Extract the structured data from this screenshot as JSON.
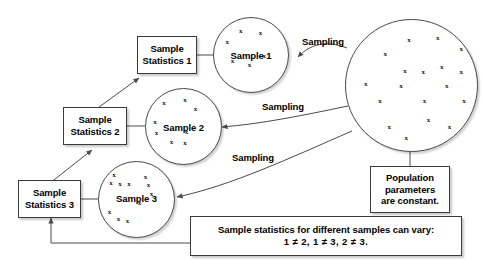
{
  "diagram": {
    "stroke_color": "#3b3b3b",
    "background": "#ffffff"
  },
  "stat_boxes": [
    {
      "line1": "Sample",
      "line2": "Statistics 1"
    },
    {
      "line1": "Sample",
      "line2": "Statistics 2"
    },
    {
      "line1": "Sample",
      "line2": "Statistics 3"
    }
  ],
  "samples": [
    {
      "label": "Sample 1",
      "x_count": 6,
      "points": [
        [
          36,
          18
        ],
        [
          63,
          20
        ],
        [
          18,
          33
        ],
        [
          68,
          52
        ],
        [
          25,
          58
        ],
        [
          48,
          64
        ]
      ]
    },
    {
      "label": "Sample 2",
      "x_count": 8,
      "points": [
        [
          24,
          18
        ],
        [
          52,
          14
        ],
        [
          66,
          27
        ],
        [
          12,
          44
        ],
        [
          14,
          58
        ],
        [
          54,
          57
        ],
        [
          34,
          71
        ],
        [
          52,
          72
        ]
      ]
    },
    {
      "label": "Sample 3",
      "x_count": 12,
      "points": [
        [
          20,
          17
        ],
        [
          62,
          20
        ],
        [
          16,
          28
        ],
        [
          28,
          29
        ],
        [
          40,
          29
        ],
        [
          66,
          30
        ],
        [
          70,
          42
        ],
        [
          54,
          54
        ],
        [
          14,
          66
        ],
        [
          26,
          76
        ],
        [
          38,
          79
        ]
      ]
    }
  ],
  "population": {
    "x_count": 18,
    "points": [
      [
        48,
        15
      ],
      [
        70,
        14
      ],
      [
        88,
        22
      ],
      [
        30,
        26
      ],
      [
        45,
        39
      ],
      [
        59,
        40
      ],
      [
        73,
        36
      ],
      [
        88,
        40
      ],
      [
        15,
        49
      ],
      [
        42,
        50
      ],
      [
        77,
        50
      ],
      [
        26,
        62
      ],
      [
        60,
        62
      ],
      [
        90,
        62
      ],
      [
        63,
        76
      ],
      [
        33,
        82
      ],
      [
        79,
        82
      ],
      [
        46,
        90
      ]
    ]
  },
  "sampling_labels": [
    {
      "text": "Sampling"
    },
    {
      "text": "Sampling"
    },
    {
      "text": "Sampling"
    }
  ],
  "population_box": {
    "line1": "Population",
    "line2": "parameters",
    "line3": "are constant."
  },
  "vary_box": {
    "line1": "Sample statistics for different samples can vary:",
    "line2": "1 ≠ 2, 1 ≠ 3, 2 ≠ 3."
  }
}
